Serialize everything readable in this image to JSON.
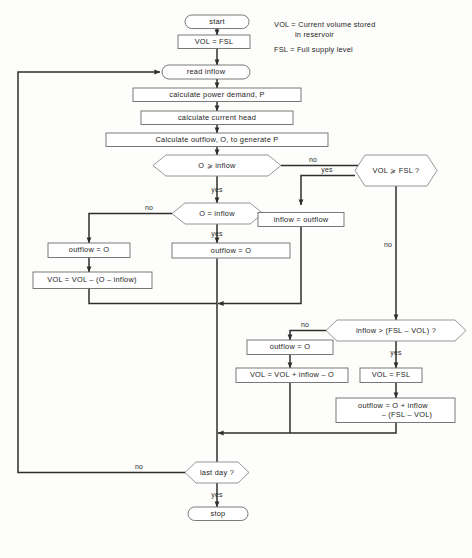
{
  "diagram": {
    "legend": [
      {
        "line1": "VOL = Current volume stored",
        "line2": "in reservoir"
      },
      {
        "line1": "FSL = Full supply level",
        "line2": ""
      }
    ],
    "nodes": {
      "start": "start",
      "init_vol": "VOL = FSL",
      "read_inflow": "read inflow",
      "calc_power": "calculate power demand, P",
      "calc_head": "calculate current head",
      "calc_outflow": "Calculate outflow, O, to generate P",
      "dec_o_ge_inflow": "O ⩾ inflow",
      "dec_o_eq_inflow": "O = inflow",
      "dec_vol_ge_fsl": "VOL ⩾ FSL ?",
      "dec_inflow_gt": "inflow > (FSL – VOL) ?",
      "outflow_eq_o_left": "outflow = O",
      "vol_minus": "VOL = VOL – (O – inflow)",
      "outflow_eq_o_mid": "outflow = O",
      "inflow_eq_outflow": "inflow = outflow",
      "outflow_eq_o_low": "outflow = O",
      "vol_plus": "VOL = VOL + inflow – O",
      "vol_eq_fsl": "VOL = FSL",
      "outflow_spill_line1": "outflow = O + inflow",
      "outflow_spill_line2": "– (FSL – VOL)",
      "dec_last_day": "last day ?",
      "stop": "stop"
    },
    "edge_labels": {
      "yes_o_ge_inflow": "yes",
      "no_o_ge_inflow": "no",
      "no_o_eq_inflow": "no",
      "yes_o_eq_inflow": "yes",
      "yes_vol_ge_fsl": "yes",
      "no_vol_ge_fsl": "no",
      "no_inflow_gt": "no",
      "yes_inflow_gt": "yes",
      "no_last_day": "no",
      "yes_last_day": "yes"
    },
    "colors": {
      "background": "#fdfdfb",
      "node_fill": "#ffffff",
      "node_stroke": "#6b6b6b",
      "flow_stroke": "#2e2e2e",
      "text": "#1d1d1d"
    }
  }
}
